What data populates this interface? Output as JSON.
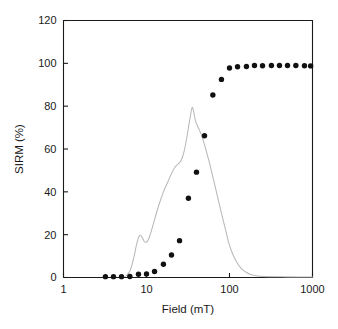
{
  "chart_data": {
    "type": "line",
    "title": "",
    "xlabel": "Field (mT)",
    "ylabel": "SIRM (%)",
    "xscale": "log",
    "xlim": [
      1,
      1000
    ],
    "ylim": [
      0,
      120
    ],
    "yticks": [
      0,
      20,
      40,
      60,
      80,
      100,
      120
    ],
    "ytick_labels": [
      "0",
      "20",
      "40",
      "60",
      "80",
      "100",
      "120"
    ],
    "xticks": [
      1,
      10,
      100,
      1000
    ],
    "xtick_labels": [
      "1",
      "10",
      "100",
      "1000"
    ],
    "grid": false,
    "legend": "none",
    "series": [
      {
        "name": "IRM acquisition",
        "marker": "filled-circle",
        "color": "#111111",
        "line": false,
        "x": [
          3.2,
          4.0,
          5.0,
          6.3,
          8.0,
          10.0,
          12.5,
          16.0,
          20.0,
          25.0,
          32.0,
          40.0,
          50.0,
          63.0,
          80.0,
          100.0,
          125.0,
          160.0,
          200.0,
          250.0,
          320.0,
          400.0,
          500.0,
          630.0,
          800.0,
          950.0
        ],
        "y": [
          0.4,
          0.4,
          0.4,
          0.5,
          1.5,
          1.6,
          2.8,
          6.2,
          10.5,
          17.2,
          37.0,
          49.2,
          66.2,
          85.2,
          92.5,
          97.8,
          98.4,
          98.5,
          99.0,
          98.9,
          99.0,
          99.0,
          99.0,
          99.0,
          98.9,
          98.8
        ]
      },
      {
        "name": "Coercivity spectrum",
        "marker": "none",
        "color": "#b8b8b8",
        "line": true,
        "x": [
          5.6,
          6.3,
          7.0,
          7.6,
          8.2,
          8.8,
          9.4,
          10.0,
          10.6,
          11.5,
          12.5,
          14.0,
          16.0,
          18.0,
          20.0,
          22.0,
          24.0,
          26.0,
          28.0,
          30.0,
          32.0,
          34.0,
          35.5,
          37.0,
          39.0,
          42.0,
          46.0,
          50.0,
          56.0,
          63.0,
          71.0,
          80.0,
          90.0,
          100.0,
          112.0,
          125.0,
          140.0,
          160.0,
          180.0,
          220.0,
          300.0,
          500.0,
          1000.0
        ],
        "y": [
          0.5,
          3.0,
          9.0,
          15.5,
          19.5,
          19.0,
          16.8,
          16.5,
          18.0,
          22.0,
          27.0,
          33.5,
          40.0,
          44.5,
          48.5,
          51.5,
          53.0,
          54.5,
          58.0,
          63.5,
          70.0,
          76.0,
          79.5,
          77.5,
          73.0,
          70.0,
          66.5,
          62.0,
          55.0,
          47.0,
          38.5,
          30.0,
          22.0,
          15.0,
          10.0,
          6.5,
          4.0,
          2.3,
          1.4,
          0.7,
          0.4,
          0.3,
          0.2
        ]
      }
    ]
  },
  "axes": {
    "x_title": "Field (mT)",
    "y_title": "SIRM (%)"
  }
}
